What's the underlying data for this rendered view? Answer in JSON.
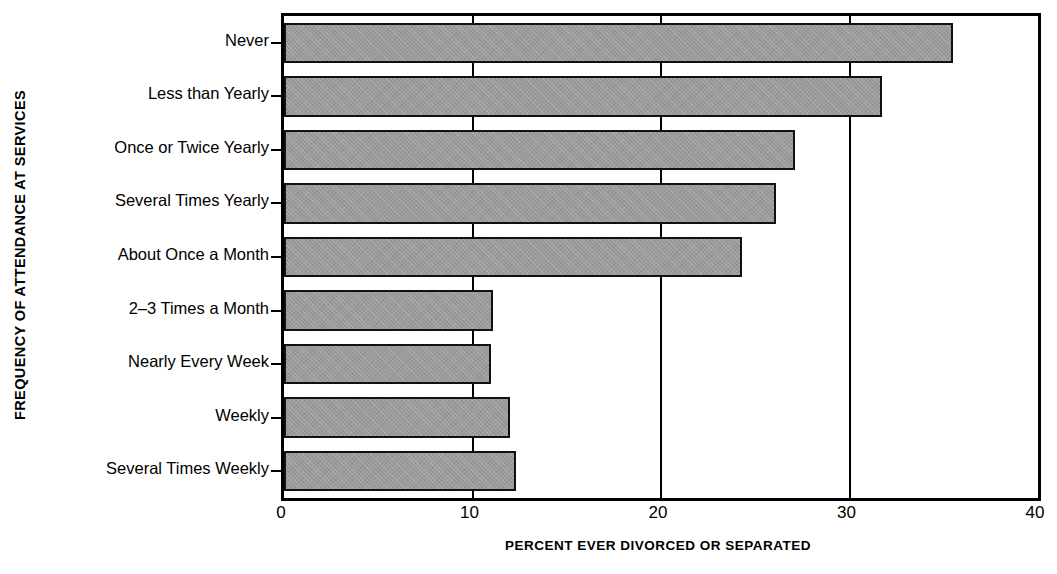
{
  "chart_data": {
    "type": "bar",
    "orientation": "horizontal",
    "title": "",
    "xlabel": "PERCENT EVER DIVORCED OR SEPARATED",
    "ylabel": "FREQUENCY OF ATTENDANCE AT SERVICES",
    "categories": [
      "Never",
      "Less than Yearly",
      "Once or Twice Yearly",
      "Several Times Yearly",
      "About Once a Month",
      "2–3 Times a Month",
      "Nearly Every Week",
      "Weekly",
      "Several Times Weekly"
    ],
    "values": [
      35.5,
      31.7,
      27.1,
      26.1,
      24.3,
      11.1,
      11.0,
      12.0,
      12.3
    ],
    "xlim": [
      0,
      40
    ],
    "xticks": [
      0,
      10,
      20,
      30,
      40
    ],
    "xtick_labels": [
      "0",
      "10",
      "20",
      "30",
      "40"
    ],
    "grid": "vertical-at-10-20-30",
    "legend": "none",
    "bar_fill_color": "#9a9a9a",
    "bar_edge_color": "#111111",
    "axis_color": "#000000",
    "background_color": "#ffffff"
  }
}
